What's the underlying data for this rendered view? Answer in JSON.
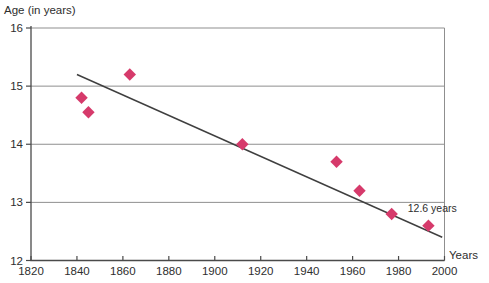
{
  "chart_data": {
    "type": "scatter",
    "title": "",
    "xlabel": "Years",
    "ylabel": "Age (in years)",
    "xlim": [
      1820,
      2000
    ],
    "ylim": [
      12,
      16
    ],
    "x_ticks": [
      1820,
      1840,
      1860,
      1880,
      1900,
      1920,
      1940,
      1960,
      1980,
      2000
    ],
    "y_ticks": [
      12,
      13,
      14,
      15,
      16
    ],
    "grid": "horizontal",
    "legend": "none",
    "series": [
      {
        "name": "age-data-points",
        "marker": "diamond",
        "points": [
          {
            "year": 1842,
            "age": 14.8
          },
          {
            "year": 1845,
            "age": 14.55
          },
          {
            "year": 1863,
            "age": 15.2
          },
          {
            "year": 1912,
            "age": 14.0
          },
          {
            "year": 1953,
            "age": 13.7
          },
          {
            "year": 1963,
            "age": 13.2
          },
          {
            "year": 1977,
            "age": 12.8
          },
          {
            "year": 1993,
            "age": 12.6
          }
        ]
      }
    ],
    "trendline": {
      "x1": 1840,
      "y1": 15.2,
      "x2": 1999,
      "y2": 12.4
    },
    "annotation": {
      "text": "12.6 years",
      "year": 1984,
      "age": 12.83
    },
    "colors": {
      "point": "#d63a6b",
      "trend": "#3f3f3f",
      "grid": "#8f8f8f",
      "axis": "#4a4a4a",
      "text": "#2e2e2e",
      "background": "#ffffff"
    }
  }
}
